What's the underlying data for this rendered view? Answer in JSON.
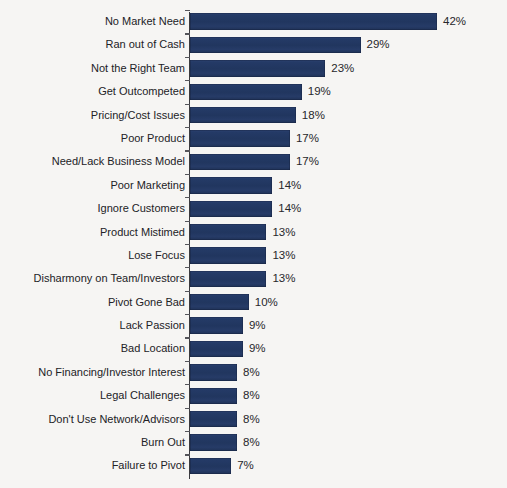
{
  "chart_data": {
    "type": "bar",
    "orientation": "horizontal",
    "title": "",
    "xlabel": "",
    "ylabel": "",
    "xlim": [
      0,
      42
    ],
    "grid": false,
    "legend": null,
    "value_suffix": "%",
    "bar_color": "#243a66",
    "background_color": "#f6f5f3",
    "text_color": "#222226",
    "categories": [
      "No Market Need",
      "Ran out of Cash",
      "Not the Right Team",
      "Get Outcompeted",
      "Pricing/Cost Issues",
      "Poor Product",
      "Need/Lack Business Model",
      "Poor Marketing",
      "Ignore Customers",
      "Product Mistimed",
      "Lose Focus",
      "Disharmony on Team/Investors",
      "Pivot Gone Bad",
      "Lack Passion",
      "Bad Location",
      "No Financing/Investor Interest",
      "Legal Challenges",
      "Don't Use Network/Advisors",
      "Burn Out",
      "Failure to Pivot"
    ],
    "values": [
      42,
      29,
      23,
      19,
      18,
      17,
      17,
      14,
      14,
      13,
      13,
      13,
      10,
      9,
      9,
      8,
      8,
      8,
      8,
      7
    ],
    "value_labels": [
      "42%",
      "29%",
      "23%",
      "19%",
      "18%",
      "17%",
      "17%",
      "14%",
      "14%",
      "13%",
      "13%",
      "13%",
      "10%",
      "9%",
      "9%",
      "8%",
      "8%",
      "8%",
      "8%",
      "7%"
    ]
  }
}
